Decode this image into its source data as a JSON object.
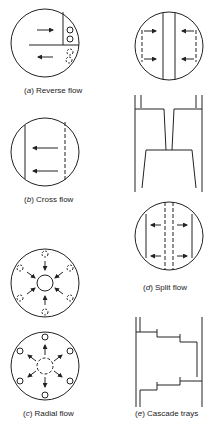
{
  "figure": {
    "panels": [
      {
        "id": "a",
        "label_letter": "a",
        "caption": "Reverse flow"
      },
      {
        "id": "b",
        "label_letter": "b",
        "caption": "Cross flow"
      },
      {
        "id": "c",
        "label_letter": "c",
        "caption": "Radial flow"
      },
      {
        "id": "d",
        "label_letter": "d",
        "caption": "Split flow"
      },
      {
        "id": "e",
        "label_letter": "e",
        "caption": "Cascade trays"
      }
    ]
  },
  "colors": {
    "line": "#222222",
    "background": "#ffffff"
  }
}
